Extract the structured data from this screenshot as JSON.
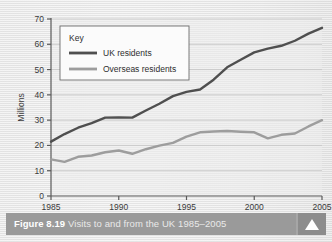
{
  "figure": {
    "number_label": "Figure 8.19",
    "caption": "Visits to and from the UK 1985–2005",
    "expand_icon": "triangle-up-icon"
  },
  "colors": {
    "uk_line": "#4f4f4f",
    "overseas_line": "#9d9d9d",
    "axis": "#5a5a5a",
    "gridline": "#c3c3c3",
    "plot_background": "#ececec",
    "caption_bar": "#9a9a9a",
    "caption_button": "#8c8c8c",
    "caption_text": "#ffffff"
  },
  "legend": {
    "title": "Key",
    "entries": [
      {
        "label": "UK residents",
        "color": "#4f4f4f"
      },
      {
        "label": "Overseas residents",
        "color": "#9d9d9d"
      }
    ]
  },
  "chart_data": {
    "type": "line",
    "title": "Visits to and from the UK 1985–2005",
    "xlabel": "",
    "ylabel": "Millions",
    "xlim": [
      1985,
      2005
    ],
    "ylim": [
      0,
      70
    ],
    "yticks": [
      0,
      10,
      20,
      30,
      40,
      50,
      60,
      70
    ],
    "xticks": [
      1985,
      1990,
      1995,
      2000,
      2005
    ],
    "ytick_labels": [
      "0",
      "10",
      "20",
      "30",
      "40",
      "50",
      "60",
      "70"
    ],
    "xtick_labels": [
      "1985",
      "1990",
      "1995",
      "2000",
      "2005"
    ],
    "grid": true,
    "grid_axis": "y",
    "legend_position": "upper-left-inset",
    "x": [
      1985,
      1986,
      1987,
      1988,
      1989,
      1990,
      1991,
      1992,
      1993,
      1994,
      1995,
      1996,
      1997,
      1998,
      1999,
      2000,
      2001,
      2002,
      2003,
      2004,
      2005
    ],
    "series": [
      {
        "name": "UK residents",
        "color": "#4f4f4f",
        "values": [
          21.5,
          24.5,
          27.0,
          28.8,
          31.0,
          31.1,
          31.0,
          33.8,
          36.5,
          39.5,
          41.2,
          42.1,
          46.0,
          50.9,
          53.9,
          56.8,
          58.3,
          59.4,
          61.4,
          64.2,
          66.5
        ]
      },
      {
        "name": "Overseas residents",
        "color": "#9d9d9d",
        "values": [
          14.5,
          13.5,
          15.5,
          16.0,
          17.3,
          18.0,
          16.7,
          18.5,
          19.9,
          21.0,
          23.5,
          25.2,
          25.5,
          25.7,
          25.4,
          25.2,
          22.8,
          24.2,
          24.7,
          27.5,
          30.0
        ]
      }
    ]
  }
}
